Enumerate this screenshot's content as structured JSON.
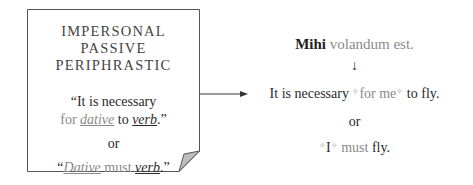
{
  "card": {
    "heading": [
      "IMPERSONAL",
      "PASSIVE",
      "PERIPHRASTIC"
    ],
    "quote1": {
      "open": "“It is necessary",
      "for": "for ",
      "dative": "dative",
      "to": " to ",
      "verb": "verb",
      "close": ".”"
    },
    "or": "or",
    "quote2": {
      "open": "“",
      "dative": "Dative",
      "must": " must ",
      "verb": "verb",
      "close": ".”"
    }
  },
  "example": {
    "latin_bold": "Mihi",
    "latin_rest": " volandum est.",
    "arrow": "↓",
    "line1": {
      "start": "It is necessary ",
      "star": "✧",
      "for_me": "for me",
      "end": " to fly."
    },
    "or": "or",
    "line2": {
      "star": "✧",
      "I": "I",
      "must": " must",
      "fly": " fly."
    }
  }
}
